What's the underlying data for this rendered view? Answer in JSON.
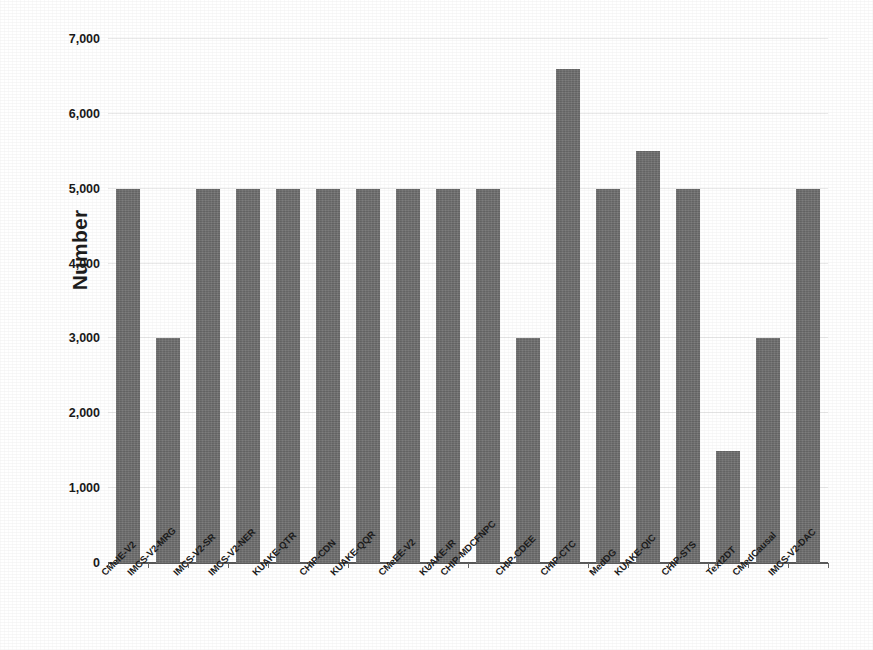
{
  "chart_data": {
    "type": "bar",
    "title": "",
    "subtitle": "",
    "xlabel": "",
    "ylabel": "Number",
    "ylim": [
      0,
      7000
    ],
    "ytick_step": 1000,
    "ytick_labels": [
      "0",
      "1,000",
      "2,000",
      "3,000",
      "4,000",
      "5,000",
      "6,000",
      "7,000"
    ],
    "yticks": [
      0,
      1000,
      2000,
      3000,
      4000,
      5000,
      6000,
      7000
    ],
    "grid": true,
    "grid_axis": "y",
    "legend": false,
    "legend_position": "none",
    "bar_color": "#6f6f6f",
    "categories": [
      "CMeIE-V2",
      "IMCS-V2-MRG",
      "IMCS-V2-SR",
      "IMCS-V2-NER",
      "KUAKE-QTR",
      "CHIP-CDN",
      "KUAKE-QQR",
      "CMeEE-V2",
      "KUAKE-IR",
      "CHIP-MDCFNPC",
      "CHIP-CDEE",
      "CHIP-CTC",
      "MedDG",
      "KUAKE-QIC",
      "CHIP-STS",
      "Text2DT",
      "CMedCausal",
      "IMCS-V2-DAC"
    ],
    "values": [
      5000,
      3000,
      5000,
      5000,
      5000,
      5000,
      5000,
      5000,
      5000,
      5000,
      3000,
      6600,
      5000,
      5500,
      5000,
      1500,
      3000,
      5000
    ]
  }
}
